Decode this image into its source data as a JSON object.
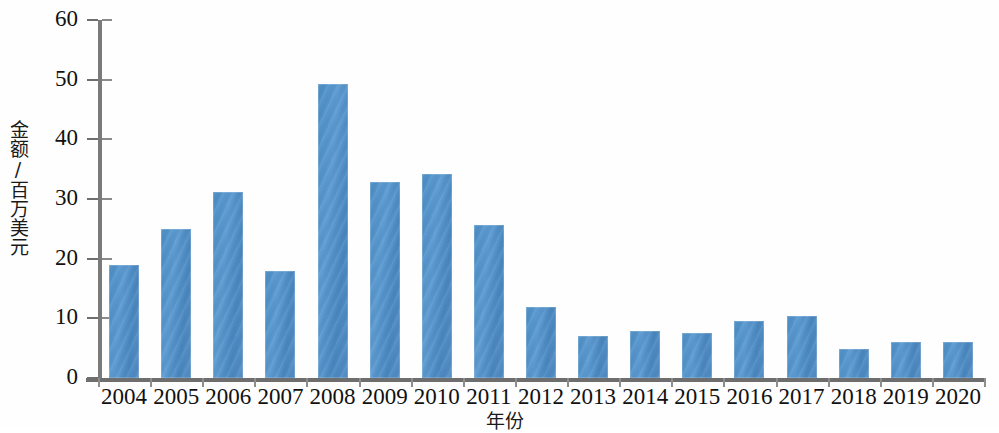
{
  "chart_data": {
    "type": "bar",
    "title": "",
    "subtitle": "",
    "xlabel": "年份",
    "ylabel": "金额/百万美元",
    "categories": [
      "2004",
      "2005",
      "2006",
      "2007",
      "2008",
      "2009",
      "2010",
      "2011",
      "2012",
      "2013",
      "2014",
      "2015",
      "2016",
      "2017",
      "2018",
      "2019",
      "2020"
    ],
    "values": [
      19.0,
      25.0,
      31.2,
      18.0,
      49.3,
      32.9,
      34.2,
      25.6,
      11.9,
      7.0,
      7.9,
      7.5,
      9.5,
      10.4,
      4.8,
      6.0,
      6.1
    ],
    "series": [
      {
        "name": "金额",
        "values": [
          19.0,
          25.0,
          31.2,
          18.0,
          49.3,
          32.9,
          34.2,
          25.6,
          11.9,
          7.0,
          7.9,
          7.5,
          9.5,
          10.4,
          4.8,
          6.0,
          6.1
        ]
      }
    ],
    "ylim": [
      0,
      60
    ],
    "ytick_labels": [
      "0",
      "10",
      "20",
      "30",
      "40",
      "50",
      "60"
    ],
    "ytick_values": [
      0,
      10,
      20,
      30,
      40,
      50,
      60
    ],
    "grid": false,
    "legend": "none",
    "bar_color": "#4f8fc6",
    "axis_color": "#6e6e6e",
    "text_color": "#111111"
  }
}
